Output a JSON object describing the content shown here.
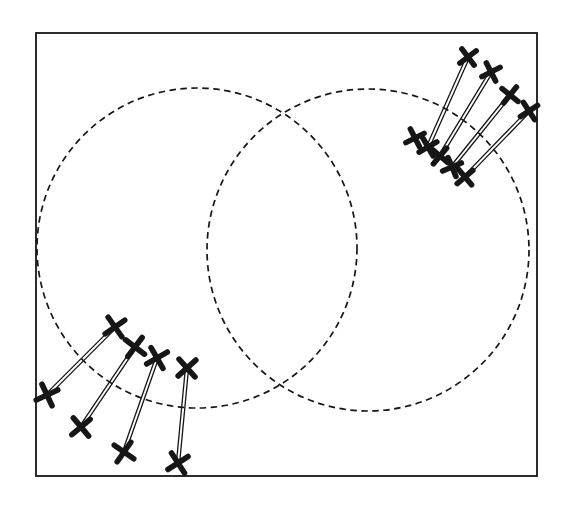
{
  "figure": {
    "canvas": {
      "width": 566,
      "height": 520
    },
    "colors": {
      "background": "#ffffff",
      "ink": "#161616"
    },
    "frame": {
      "x": 36,
      "y": 33,
      "width": 501,
      "height": 443,
      "stroke_width": 1.8
    },
    "circles": [
      {
        "id": "left-circle",
        "cx": 197,
        "cy": 248,
        "r": 160,
        "dash": "6.5 4.5",
        "stroke_width": 1.7
      },
      {
        "id": "right-circle",
        "cx": 368,
        "cy": 250,
        "r": 161,
        "dash": "6.5 4.5",
        "stroke_width": 1.7
      }
    ],
    "marker_style": {
      "arm": 8,
      "stroke_width": 5.6
    },
    "connector_style": {
      "gap": 3.2,
      "stroke_width": 1.3
    },
    "groups": [
      {
        "name": "upper-right-group",
        "marker_arm": 7.2,
        "pairs": [
          {
            "inner": [
              428,
              147
            ],
            "outer": [
              468,
              57
            ],
            "inner_angle": 15,
            "outer_angle": 8
          },
          {
            "inner": [
              440,
              156
            ],
            "outer": [
              491,
              72
            ],
            "inner_angle": -5,
            "outer_angle": 18
          },
          {
            "inner": [
              452,
              167
            ],
            "outer": [
              510,
              95
            ],
            "inner_angle": 22,
            "outer_angle": -6
          },
          {
            "inner": [
              465,
              177
            ],
            "outer": [
              529,
              111
            ],
            "inner_angle": 5,
            "outer_angle": 12
          }
        ],
        "extra_markers": [
          {
            "pos": [
              415,
              138
            ],
            "angle": 18
          }
        ]
      },
      {
        "name": "lower-left-group",
        "marker_arm": 8.4,
        "pairs": [
          {
            "inner": [
              115,
              327
            ],
            "outer": [
              47,
              395
            ],
            "inner_angle": 10,
            "outer_angle": 20
          },
          {
            "inner": [
              135,
              347
            ],
            "outer": [
              81,
              427
            ],
            "inner_angle": -8,
            "outer_angle": 5
          },
          {
            "inner": [
              157,
              358
            ],
            "outer": [
              124,
              452
            ],
            "inner_angle": 15,
            "outer_angle": -10
          },
          {
            "inner": [
              187,
              368
            ],
            "outer": [
              178,
              463
            ],
            "inner_angle": 3,
            "outer_angle": 12
          }
        ],
        "extra_markers": []
      }
    ]
  }
}
